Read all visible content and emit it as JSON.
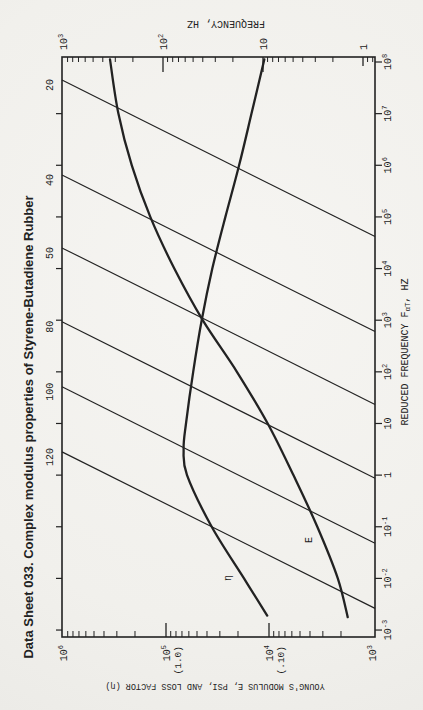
{
  "page": {
    "bg": "#f3f2ef",
    "ink": "#222222"
  },
  "chart_data": {
    "type": "line",
    "title": "Data Sheet 033.  Complex modulus properties of Styrene-Butadiene Rubber",
    "orientation_note": "chart is rotated 90 degrees counter-clockwise on the page",
    "x_axis": {
      "label_pre": "REDUCED FREQUENCY F",
      "label_sub": "αT",
      "label_post": ", HZ",
      "log_range": [
        -3,
        8
      ],
      "tick_exponents": [
        8,
        7,
        6,
        5,
        4,
        3,
        2,
        1,
        0,
        -1,
        -2,
        -3
      ]
    },
    "y_axis": {
      "label": "YOUNG'S MODULUS E, PSI, AND LOSS FACTOR (η)",
      "log_range": [
        3,
        6
      ],
      "ticks": [
        {
          "base": "10",
          "exp": "6",
          "note": ""
        },
        {
          "base": "10",
          "exp": "5",
          "note": "(1.0)"
        },
        {
          "base": "10",
          "exp": "4",
          "note": "(.10)"
        },
        {
          "base": "10",
          "exp": "3",
          "note": ""
        }
      ]
    },
    "frequency_axis": {
      "label": "FREQUENCY, HZ",
      "log_range": [
        0,
        3
      ],
      "ticks": [
        {
          "base": "10",
          "exp": "3"
        },
        {
          "base": "10",
          "exp": "2"
        },
        {
          "base": "10",
          "exp": ""
        },
        {
          "base": "1",
          "exp": ""
        }
      ]
    },
    "series": [
      {
        "name": "E",
        "label": "E",
        "units": "psi",
        "log_reduced_frequency": [
          8.05,
          7,
          6,
          5,
          4,
          3,
          2,
          1,
          0,
          -1,
          -2,
          -2.75
        ],
        "values": [
          350000,
          290000,
          215000,
          142000,
          83000,
          44000,
          20500,
          10300,
          5800,
          3400,
          2150,
          1720
        ]
      },
      {
        "name": "eta",
        "label": "η",
        "units": "loss factor",
        "log_reduced_frequency": [
          8.05,
          7,
          6,
          5,
          4,
          3,
          2,
          1,
          0.5,
          0,
          -1,
          -2,
          -2.72
        ],
        "values": [
          0.111,
          0.148,
          0.195,
          0.265,
          0.355,
          0.45,
          0.545,
          0.64,
          0.675,
          0.625,
          0.36,
          0.175,
          0.104
        ]
      }
    ],
    "isotherms": {
      "labels": [
        "20",
        "40",
        "50",
        "80",
        "100",
        "120"
      ],
      "start_log_reduced_frequency": [
        7.65,
        5.81,
        4.4,
        2.97,
        1.71,
        0.45
      ],
      "slope_log_rf_per_log_hz": 1
    }
  }
}
